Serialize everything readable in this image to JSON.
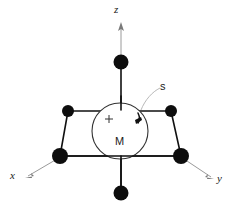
{
  "figure": {
    "background_color": "#ffffff",
    "axes": [
      {
        "id": "z",
        "label": "z",
        "direction": "up",
        "color": "#9a9a9a"
      },
      {
        "id": "x",
        "label": "x",
        "direction": "down-left",
        "color": "#9a9a9a"
      },
      {
        "id": "y",
        "label": "y",
        "direction": "down-right",
        "color": "#9a9a9a"
      }
    ],
    "center": {
      "label": "M",
      "charge_symbol": "+",
      "shape": "circle",
      "stroke_color": "#333333"
    },
    "spin": {
      "label": "s",
      "annotation_color": "#b0b0b0",
      "arrow_color": "#111111"
    },
    "ligands": [
      {
        "id": "axial-top",
        "position": "top",
        "color": "#0d0d0d",
        "radius": 7.5
      },
      {
        "id": "axial-bottom",
        "position": "bottom",
        "color": "#0d0d0d",
        "radius": 7.5
      },
      {
        "id": "equatorial-back-left",
        "position": "back-left",
        "color": "#0d0d0d",
        "radius": 6.0
      },
      {
        "id": "equatorial-back-right",
        "position": "back-right",
        "color": "#0d0d0d",
        "radius": 6.0
      },
      {
        "id": "equatorial-front-left",
        "position": "front-left",
        "color": "#0d0d0d",
        "radius": 8.0
      },
      {
        "id": "equatorial-front-right",
        "position": "front-right",
        "color": "#0d0d0d",
        "radius": 8.0
      }
    ],
    "bond_color": "#111111"
  }
}
